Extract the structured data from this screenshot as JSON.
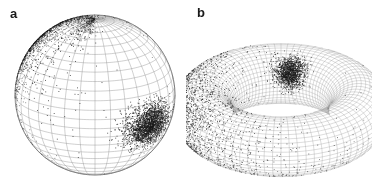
{
  "figure": {
    "background_color": "#ffffff",
    "width": 372,
    "height": 190,
    "mesh_color": "#8c8c8c",
    "point_color": "#1a1a1a"
  },
  "panels": [
    {
      "label": "a",
      "label_x": 10,
      "label_y": 7,
      "surface": "sphere",
      "center_x": 95,
      "center_y": 95,
      "radius": 80
    },
    {
      "label": "b",
      "label_x": 197,
      "label_y": 6,
      "surface": "torus",
      "center_x": 281,
      "center_y": 110,
      "major_radius": 78,
      "minor_radius": 30
    }
  ],
  "chart_data": [
    {
      "type": "scatter",
      "title": "a",
      "surface": "sphere",
      "projection": "orthographic-3d",
      "xlabel": "",
      "ylabel": "",
      "grid": true,
      "legend": "none",
      "mesh": {
        "meridians": 32,
        "parallels": 26,
        "line_color": "#8c8c8c",
        "line_width": 0.5
      },
      "geometry": {
        "center_px": [
          95,
          95
        ],
        "radius_px": 80,
        "view_tilt_deg": 18,
        "view_rotation_deg": 0
      },
      "clusters": [
        {
          "name": "upper-left-cluster",
          "description": "large diffuse high-density patch on upper-left limb, saturated black core fading outward with scattered individual points",
          "center_lon_deg": -115,
          "center_lat_deg": 38,
          "angular_spread_deg": 42,
          "n_points": 3200,
          "peak_density": "saturated",
          "center_px": [
            52,
            52
          ],
          "extent_px": [
            78,
            70
          ],
          "falloff": "broad-gaussian-with-tail"
        },
        {
          "name": "right-equatorial-cluster",
          "description": "compact elliptical dark blob below and right of center, sharp-edged uniform core",
          "center_lon_deg": 45,
          "center_lat_deg": -10,
          "angular_spread_deg": 20,
          "n_points": 2400,
          "peak_density": "saturated",
          "center_px": [
            130,
            100
          ],
          "extent_px": [
            56,
            36
          ],
          "falloff": "tight-gaussian"
        },
        {
          "name": "north-pole-wisp",
          "description": "faint sparse speckle ring near the visible north pole",
          "center_lon_deg": -30,
          "center_lat_deg": 78,
          "angular_spread_deg": 14,
          "n_points": 260,
          "peak_density": "light",
          "center_px": [
            96,
            22
          ],
          "extent_px": [
            38,
            14
          ],
          "falloff": "sparse"
        }
      ],
      "total_points": 5860
    },
    {
      "type": "scatter",
      "title": "b",
      "surface": "torus",
      "projection": "orthographic-3d",
      "xlabel": "",
      "ylabel": "",
      "grid": true,
      "legend": "none",
      "mesh": {
        "toroidal_lines": 80,
        "poloidal_lines": 42,
        "line_color": "#8c8c8c",
        "line_width": 0.4
      },
      "geometry": {
        "center_px": [
          281,
          110
        ],
        "major_radius_px": 78,
        "minor_radius_px": 30,
        "view_elevation_deg": 28,
        "hole_center_px": [
          286,
          120
        ],
        "hole_extent_px": [
          52,
          22
        ]
      },
      "clusters": [
        {
          "name": "left-outer-cluster",
          "description": "large dense black patch on the left outer wall of the torus, fading into speckle toward the lower front",
          "center_toroidal_deg": 188,
          "center_poloidal_deg": 20,
          "angular_spread_deg": 50,
          "n_points": 3100,
          "peak_density": "saturated",
          "center_px": [
            232,
            104
          ],
          "extent_px": [
            64,
            76
          ],
          "falloff": "broad-gaussian-with-tail"
        },
        {
          "name": "inner-top-cluster",
          "description": "compact dark teardrop patch on the inner upper wall, right of the hole",
          "center_toroidal_deg": 80,
          "center_poloidal_deg": 150,
          "angular_spread_deg": 18,
          "n_points": 1500,
          "peak_density": "saturated",
          "center_px": [
            299,
            88
          ],
          "extent_px": [
            24,
            34
          ],
          "falloff": "tight-gaussian"
        },
        {
          "name": "front-lower-speckle",
          "description": "sparse scattered points across the lower front face of the torus",
          "center_toroidal_deg": 250,
          "center_poloidal_deg": 300,
          "angular_spread_deg": 46,
          "n_points": 540,
          "peak_density": "light",
          "center_px": [
            252,
            140
          ],
          "extent_px": [
            70,
            40
          ],
          "falloff": "sparse"
        }
      ],
      "total_points": 5140
    }
  ]
}
